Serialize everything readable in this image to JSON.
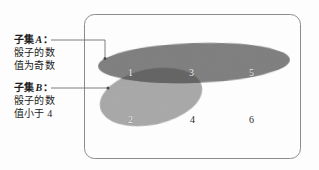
{
  "figure": {
    "title": "",
    "type": "venn-diagram",
    "universe_shape": "rounded-rectangle"
  },
  "labels": {
    "set_a": {
      "heading": "子集",
      "name": "A",
      "colon": "：",
      "line2": "骰子的数",
      "line3": "值为奇数"
    },
    "set_b": {
      "heading": "子集",
      "name": "B",
      "colon": "：",
      "line2": "骰子的数",
      "line3": "值小于 4"
    }
  },
  "elements": [
    {
      "value": "1",
      "region": "A-and-B",
      "x": 128,
      "y": 67,
      "tone": "light"
    },
    {
      "value": "3",
      "region": "A-and-B",
      "x": 189,
      "y": 67,
      "tone": "light"
    },
    {
      "value": "5",
      "region": "A-only",
      "x": 249,
      "y": 67,
      "tone": "light"
    },
    {
      "value": "2",
      "region": "B-only",
      "x": 128,
      "y": 114,
      "tone": "light"
    },
    {
      "value": "4",
      "region": "outside-both",
      "x": 190,
      "y": 114,
      "tone": "dark"
    },
    {
      "value": "6",
      "region": "outside-both",
      "x": 249,
      "y": 114,
      "tone": "dark"
    }
  ],
  "colors": {
    "set_a_fill": "#828282",
    "set_b_fill": "#ababab",
    "overlap_fill": "#6b6b6b",
    "universe_border": "#8c8c8c",
    "leader_line": "#6f6f6f",
    "text": "#1b1b1b",
    "number_light": "#f2f2f2",
    "number_dark": "#2a2a2a",
    "background": "#fdfdfd"
  }
}
